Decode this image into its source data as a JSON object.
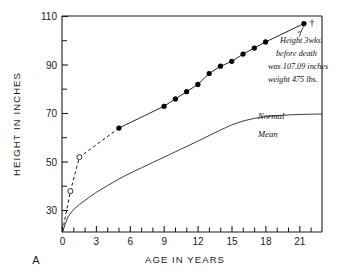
{
  "chart_data": {
    "type": "line",
    "title": "",
    "panel_label": "A",
    "xlabel": "AGE IN YEARS",
    "ylabel": "HEIGHT IN INCHES",
    "xlim": [
      0,
      23
    ],
    "ylim": [
      21,
      110
    ],
    "grid": false,
    "legend_position": "inline-annotations",
    "x_ticks_major": [
      0,
      3,
      6,
      9,
      12,
      15,
      18,
      21
    ],
    "x_tick_labels": [
      "0",
      "3",
      "6",
      "9",
      "12",
      "15",
      "18",
      "21"
    ],
    "x_ticks_minor": [
      1,
      2,
      4,
      5,
      7,
      8,
      10,
      11,
      13,
      14,
      16,
      17,
      19,
      20,
      22
    ],
    "y_ticks_major": [
      30,
      50,
      70,
      90,
      110
    ],
    "y_tick_labels": [
      "30",
      "50",
      "70",
      "90",
      "110"
    ],
    "y_ticks_minor": [
      40,
      60,
      80,
      100
    ],
    "series": [
      {
        "name": "Subject height (measured)",
        "style": "solid-line-with-filled-circles",
        "marker": "filled-circle",
        "x": [
          5,
          9,
          10,
          11,
          12,
          13,
          14,
          15,
          16,
          17,
          18,
          21.4
        ],
        "y": [
          64.0,
          73.0,
          76.0,
          79.0,
          82.0,
          86.5,
          89.5,
          91.5,
          94.5,
          97.0,
          99.5,
          107.09
        ]
      },
      {
        "name": "Subject height (early, estimated)",
        "style": "dashed-line-with-open-circles",
        "marker": "open-circle",
        "x": [
          0.0,
          0.7,
          1.5,
          5
        ],
        "y": [
          21.5,
          38.0,
          52.0,
          64.0
        ]
      },
      {
        "name": "Normal Mean",
        "style": "solid-thin-line",
        "marker": "none",
        "x": [
          0,
          0.25,
          0.5,
          1,
          1.5,
          2,
          3,
          4,
          5,
          6,
          7,
          8,
          9,
          10,
          11,
          12,
          13,
          14,
          15,
          16,
          17,
          18,
          19,
          20,
          21,
          22,
          23
        ],
        "y": [
          21.0,
          24.5,
          27.5,
          30.5,
          32.5,
          34.2,
          37.5,
          40.3,
          43.0,
          45.4,
          47.6,
          49.8,
          52.0,
          54.2,
          56.4,
          58.6,
          60.9,
          63.2,
          65.3,
          66.9,
          68.0,
          68.7,
          69.1,
          69.4,
          69.6,
          69.7,
          69.8
        ]
      }
    ],
    "annotations": [
      {
        "name": "death-annotation",
        "lines": [
          "Height 3wks.",
          "before death",
          "was 107.09 inches",
          "weight 475 lbs."
        ],
        "points_to": "final-data-point"
      },
      {
        "name": "normal-curve-label-upper",
        "text": "Normal"
      },
      {
        "name": "normal-curve-label-lower",
        "text": "Mean"
      },
      {
        "name": "death-marker",
        "text": "†"
      }
    ],
    "colors": {
      "line": "#1a1a1a",
      "marker_fill": "#000000",
      "marker_open_fill": "#ffffff",
      "axis": "#1a1a1a",
      "background": "#ffffff"
    }
  }
}
